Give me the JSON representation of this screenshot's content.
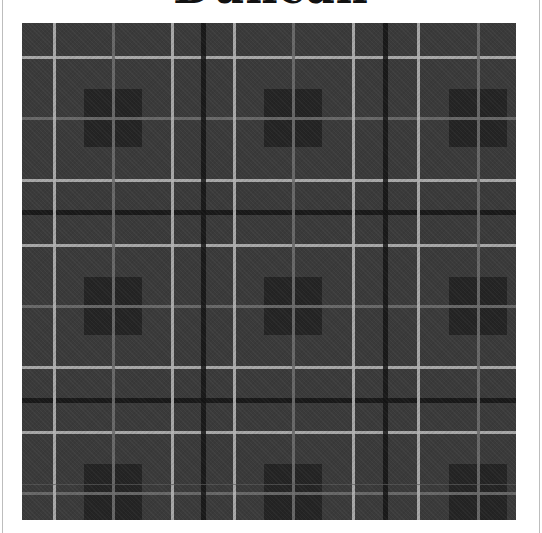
{
  "title": "Duncan",
  "tartan": {
    "name": "Duncan",
    "colors": {
      "ground": "#3a3a3a",
      "bright_stripe": "#b4b4b4",
      "dim_stripe": "#6e6e6e",
      "black_stripe": "#141414",
      "block": "#242424",
      "frame_line": "#bdbdbd"
    },
    "vertical_stripes": [
      {
        "x": 32,
        "type": "bright"
      },
      {
        "x": 91,
        "type": "dim"
      },
      {
        "x": 150,
        "type": "bright"
      },
      {
        "x": 181,
        "type": "black"
      },
      {
        "x": 212,
        "type": "bright"
      },
      {
        "x": 271,
        "type": "dim"
      },
      {
        "x": 331,
        "type": "bright"
      },
      {
        "x": 363,
        "type": "black"
      },
      {
        "x": 396,
        "type": "bright"
      },
      {
        "x": 456,
        "type": "dim"
      }
    ],
    "horizontal_stripes": [
      {
        "y": 34,
        "type": "bright"
      },
      {
        "y": 95,
        "type": "dim"
      },
      {
        "y": 157,
        "type": "bright"
      },
      {
        "y": 189,
        "type": "black"
      },
      {
        "y": 222,
        "type": "bright"
      },
      {
        "y": 283,
        "type": "dim"
      },
      {
        "y": 344,
        "type": "bright"
      },
      {
        "y": 377,
        "type": "black"
      },
      {
        "y": 409,
        "type": "bright"
      },
      {
        "y": 470,
        "type": "dim"
      }
    ],
    "block_centers_x": [
      91,
      271,
      456
    ],
    "block_centers_y": [
      95,
      283,
      470
    ],
    "block_size": 58
  }
}
